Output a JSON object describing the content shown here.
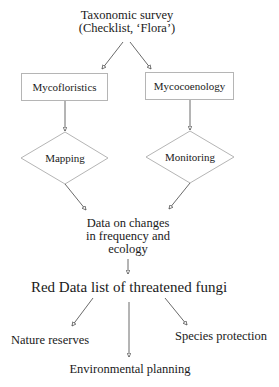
{
  "diagram": {
    "type": "flowchart",
    "nodes": {
      "taxonomic_survey": {
        "line1": "Taxonomic survey",
        "line2": "(Checklist, ‘Flora’)",
        "shape": "text"
      },
      "mycofloristics": {
        "label": "Mycofloristics",
        "shape": "rectangle"
      },
      "mycocoenology": {
        "label": "Mycocoenology",
        "shape": "rectangle"
      },
      "mapping": {
        "label": "Mapping",
        "shape": "diamond"
      },
      "monitoring": {
        "label": "Monitoring",
        "shape": "diamond"
      },
      "data_changes": {
        "line1": "Data on changes",
        "line2": "in frequency and",
        "line3": "ecology",
        "shape": "text"
      },
      "red_data_list": {
        "label": "Red Data list of threatened fungi",
        "shape": "text"
      },
      "nature_reserves": {
        "label": "Nature reserves",
        "shape": "text"
      },
      "environmental_planning": {
        "label": "Environmental planning",
        "shape": "text"
      },
      "species_protection": {
        "label": "Species protection",
        "shape": "text"
      }
    },
    "edges": [
      {
        "from": "taxonomic_survey",
        "to": "mycofloristics"
      },
      {
        "from": "taxonomic_survey",
        "to": "mycocoenology"
      },
      {
        "from": "mycofloristics",
        "to": "mapping"
      },
      {
        "from": "mycocoenology",
        "to": "monitoring"
      },
      {
        "from": "mapping",
        "to": "data_changes"
      },
      {
        "from": "monitoring",
        "to": "data_changes"
      },
      {
        "from": "data_changes",
        "to": "red_data_list"
      },
      {
        "from": "red_data_list",
        "to": "nature_reserves"
      },
      {
        "from": "red_data_list",
        "to": "environmental_planning"
      },
      {
        "from": "red_data_list",
        "to": "species_protection"
      }
    ],
    "colors": {
      "text": "#1a1a1a",
      "shape_border": "#b5b5b5",
      "edge": "#444444",
      "background": "#ffffff"
    }
  }
}
